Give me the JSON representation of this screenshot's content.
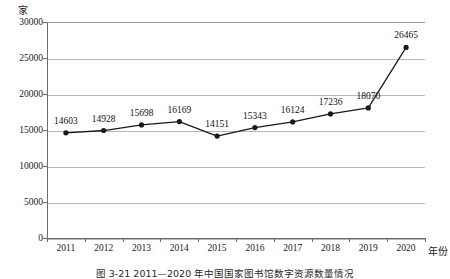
{
  "chart_data": {
    "type": "line",
    "title": "",
    "caption": "图 3-21  2011—2020 年中国国家图书馆数字资源数量情况",
    "xlabel": "年份",
    "ylabel": "",
    "yunit": "家",
    "categories": [
      "2011",
      "2012",
      "2013",
      "2014",
      "2015",
      "2016",
      "2017",
      "2018",
      "2019",
      "2020"
    ],
    "values": [
      14603,
      14928,
      15698,
      16169,
      14151,
      15343,
      16124,
      17236,
      18070,
      26465
    ],
    "data_labels": [
      "14603",
      "14928",
      "15698",
      "16169",
      "14151",
      "15343",
      "16124",
      "17236",
      "18070",
      "26465"
    ],
    "ytick_labels": [
      "30000",
      "25000",
      "20000",
      "15000",
      "10000",
      "5000",
      "0"
    ],
    "ytick_values": [
      30000,
      25000,
      20000,
      15000,
      10000,
      5000,
      0
    ],
    "ylim": [
      0,
      30000
    ],
    "grid": true,
    "legend": "none",
    "series_color": "#1a1a1a",
    "marker": "filled-circle",
    "grid_color": "#b8b8b8"
  }
}
